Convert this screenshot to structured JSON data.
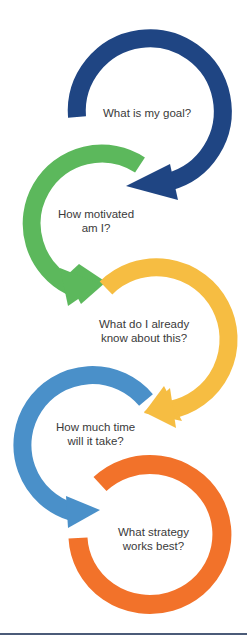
{
  "steps": [
    {
      "id": "goal",
      "line1": "What is my goal?",
      "line2": "",
      "color": "#1f4583"
    },
    {
      "id": "motivation",
      "line1": "How motivated",
      "line2": "am I?",
      "color": "#5cb85c"
    },
    {
      "id": "prior_knowledge",
      "line1": "What do I already",
      "line2": "know about this?",
      "color": "#f6bd42"
    },
    {
      "id": "time",
      "line1": "How much time",
      "line2": "will it take?",
      "color": "#4a90c9"
    },
    {
      "id": "strategy",
      "line1": "What strategy",
      "line2": "works best?",
      "color": "#f2722a"
    }
  ],
  "footer": {
    "rule_color": "#4b5b78"
  }
}
